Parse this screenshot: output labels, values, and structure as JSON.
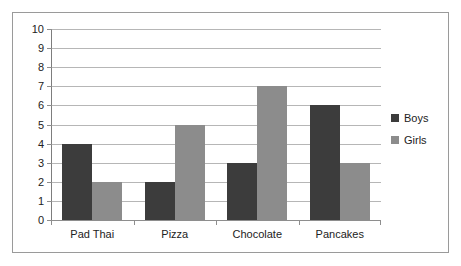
{
  "chart_data": {
    "type": "bar",
    "title": "",
    "subtitle": "",
    "xlabel": "",
    "ylabel": "",
    "categories": [
      "Pad Thai",
      "Pizza",
      "Chocolate",
      "Pancakes"
    ],
    "series": [
      {
        "name": "Boys",
        "color": "#3c3c3c",
        "values": [
          4,
          2,
          3,
          6
        ]
      },
      {
        "name": "Girls",
        "color": "#8c8c8c",
        "values": [
          2,
          5,
          7,
          3
        ]
      }
    ],
    "ylim": [
      0,
      10
    ],
    "ytick_labels": [
      "0",
      "1",
      "2",
      "3",
      "4",
      "5",
      "6",
      "7",
      "8",
      "9",
      "10"
    ],
    "ytick_values": [
      0,
      1,
      2,
      3,
      4,
      5,
      6,
      7,
      8,
      9,
      10
    ],
    "grid": true,
    "grid_axis": "y",
    "legend": true,
    "legend_position": "right",
    "legend_entries": [
      "Boys",
      "Girls"
    ],
    "border": true,
    "background_color": "#ffffff",
    "grid_color": "#b6b6b6",
    "axis_color": "#8e8e8e",
    "border_color": "#9a9a9a",
    "text_color": "#222222"
  }
}
